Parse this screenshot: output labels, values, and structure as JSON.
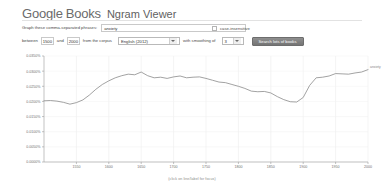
{
  "header": {
    "brand_google": "Google",
    "brand_books": "Books",
    "product": "Ngram Viewer"
  },
  "query_row": {
    "label": "Graph these comma-separated phrases:",
    "input_value": "anxiety",
    "input_placeholder": "",
    "case_insensitive_label": "case-insensitive"
  },
  "options_row": {
    "between_label": "between",
    "year_start": "1500",
    "and_label": "and",
    "year_end": "2000",
    "corpus_label": "from the corpus",
    "corpus_value": "English (2012)",
    "smoothing_label": "with smoothing of",
    "smoothing_value": "3",
    "search_button": "Search lots of books"
  },
  "chart_data": {
    "type": "line",
    "title": "",
    "xlabel": "(click on line/label for focus)",
    "ylabel": "",
    "grid": true,
    "legend_position": "line-end",
    "xlim": [
      1500,
      2000
    ],
    "ylim": [
      0.0,
      0.00035
    ],
    "xticks": [
      1500,
      1550,
      1600,
      1650,
      1700,
      1750,
      1800,
      1850,
      1900,
      1950,
      2000
    ],
    "xtick_labels": [
      "1500",
      "1550",
      "1600",
      "1650",
      "1700",
      "1750",
      "1800",
      "1850",
      "1900",
      "1950",
      "2000"
    ],
    "yticks": [
      0.0,
      5e-05,
      0.0001,
      0.00015,
      0.0002,
      0.00025,
      0.0003,
      0.00035
    ],
    "ytick_labels": [
      "0.0000%",
      "0.0050%",
      "0.0100%",
      "0.0150%",
      "0.0200%",
      "0.0250%",
      "0.0300%",
      "0.0350%"
    ],
    "series": [
      {
        "name": "anxiety",
        "color": "#8a8a8a",
        "x": [
          1500,
          1510,
          1520,
          1530,
          1540,
          1550,
          1560,
          1570,
          1580,
          1590,
          1600,
          1610,
          1620,
          1630,
          1640,
          1650,
          1660,
          1670,
          1680,
          1690,
          1700,
          1710,
          1720,
          1730,
          1740,
          1750,
          1760,
          1770,
          1780,
          1790,
          1800,
          1810,
          1820,
          1830,
          1840,
          1850,
          1860,
          1870,
          1880,
          1890,
          1900,
          1910,
          1920,
          1930,
          1940,
          1950,
          1960,
          1970,
          1980,
          1990,
          2000
        ],
        "values": [
          0.000202,
          0.000203,
          0.000201,
          0.000197,
          0.000191,
          0.000196,
          0.000205,
          0.000221,
          0.00024,
          0.000256,
          0.000268,
          0.000278,
          0.000285,
          0.00029,
          0.000288,
          0.000297,
          0.000285,
          0.000278,
          0.00028,
          0.000276,
          0.000281,
          0.000284,
          0.000278,
          0.00028,
          0.000281,
          0.000276,
          0.00027,
          0.000264,
          0.000262,
          0.000256,
          0.00025,
          0.000243,
          0.000234,
          0.000232,
          0.000233,
          0.000228,
          0.000216,
          0.000206,
          0.000199,
          0.000198,
          0.000213,
          0.000253,
          0.000278,
          0.00028,
          0.000284,
          0.000292,
          0.000291,
          0.00029,
          0.000294,
          0.000297,
          0.000305
        ]
      }
    ]
  }
}
